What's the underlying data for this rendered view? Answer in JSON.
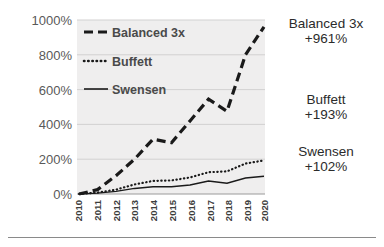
{
  "chart_data": {
    "type": "line",
    "title": "",
    "xlabel": "",
    "ylabel": "",
    "x": [
      2010,
      2011,
      2012,
      2013,
      2014,
      2015,
      2016,
      2017,
      2018,
      2019,
      2020
    ],
    "categories": [
      "2010",
      "2011",
      "2012",
      "2013",
      "2014",
      "2015",
      "2016",
      "2017",
      "2018",
      "2019",
      "2020"
    ],
    "ylim": [
      0,
      1000
    ],
    "yticks": [
      0,
      200,
      400,
      600,
      800,
      1000
    ],
    "ytick_labels": [
      "0%",
      "200%",
      "400%",
      "600%",
      "800%",
      "1000%"
    ],
    "grid": true,
    "legend_position": "top-left",
    "series": [
      {
        "name": "Balanced 3x",
        "style": "dashed",
        "color": "#1a1a1a",
        "values": [
          0,
          25,
          105,
          200,
          315,
          295,
          420,
          545,
          475,
          800,
          961
        ]
      },
      {
        "name": "Buffett",
        "style": "dotted",
        "color": "#1a1a1a",
        "values": [
          0,
          8,
          25,
          55,
          75,
          78,
          95,
          125,
          130,
          175,
          193
        ]
      },
      {
        "name": "Swensen",
        "style": "solid",
        "color": "#1a1a1a",
        "values": [
          0,
          5,
          15,
          32,
          42,
          42,
          52,
          75,
          62,
          92,
          102
        ]
      }
    ],
    "annotations": [
      {
        "name": "Balanced 3x",
        "value": "+961%"
      },
      {
        "name": "Buffett",
        "value": "+193%"
      },
      {
        "name": "Swensen",
        "value": "+102%"
      }
    ]
  },
  "legend": {
    "items": [
      {
        "label": "Balanced 3x",
        "style": "dashed"
      },
      {
        "label": "Buffett",
        "style": "dotted"
      },
      {
        "label": "Swensen",
        "style": "solid"
      }
    ]
  },
  "colors": {
    "plot_background": "#efeeee",
    "gridline": "#d2d1d1",
    "series_line": "#1a1a1a",
    "axis_text": "#595959",
    "annotation_text": "#2b2b2b",
    "rule": "#8a8a8a"
  }
}
